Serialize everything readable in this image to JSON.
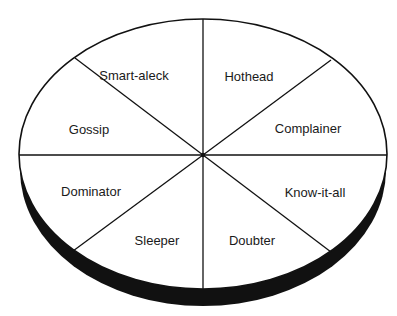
{
  "diagram": {
    "type": "3d-pie-wheel",
    "segments": [
      {
        "label": "Smart-aleck",
        "x": 134,
        "y": 75
      },
      {
        "label": "Hothead",
        "x": 249,
        "y": 76
      },
      {
        "label": "Complainer",
        "x": 308,
        "y": 128
      },
      {
        "label": "Know-it-all",
        "x": 315,
        "y": 192
      },
      {
        "label": "Doubter",
        "x": 252,
        "y": 240
      },
      {
        "label": "Sleeper",
        "x": 157,
        "y": 240
      },
      {
        "label": "Dominator",
        "x": 91,
        "y": 191
      },
      {
        "label": "Gossip",
        "x": 89,
        "y": 129
      }
    ],
    "colors": {
      "face": "#ffffff",
      "outline": "#111111",
      "edge": "#111111"
    }
  }
}
